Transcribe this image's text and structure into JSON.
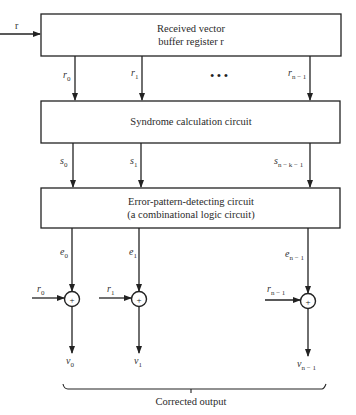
{
  "diagram": {
    "input": {
      "label": "r"
    },
    "blocks": [
      {
        "id": "buffer",
        "lines": [
          "Received vector",
          "buffer register r"
        ]
      },
      {
        "id": "syndrome",
        "lines": [
          "Syndrome calculation circuit"
        ]
      },
      {
        "id": "error-detect",
        "lines": [
          "Error-pattern-detecting circuit",
          "(a combinational logic circuit)"
        ]
      }
    ],
    "buffer_outputs": [
      {
        "base": "r",
        "sub": "0"
      },
      {
        "base": "r",
        "sub": "1"
      },
      {
        "base": "r",
        "sub": "n − 1"
      }
    ],
    "ellipsis": "• • •",
    "syndrome_outputs": [
      {
        "base": "s",
        "sub": "0"
      },
      {
        "base": "s",
        "sub": "1"
      },
      {
        "base": "s",
        "sub": "n − k − 1"
      }
    ],
    "error_outputs": [
      {
        "base": "e",
        "sub": "0"
      },
      {
        "base": "e",
        "sub": "1"
      },
      {
        "base": "e",
        "sub": "n − 1"
      }
    ],
    "adder_inputs": [
      {
        "base": "r",
        "sub": "0"
      },
      {
        "base": "r",
        "sub": "1"
      },
      {
        "base": "r",
        "sub": "n − 1"
      }
    ],
    "adder_symbol": "+",
    "outputs": [
      {
        "base": "v",
        "sub": "0"
      },
      {
        "base": "v",
        "sub": "1"
      },
      {
        "base": "v",
        "sub": "n − 1"
      }
    ],
    "output_group_label": "Corrected output"
  }
}
